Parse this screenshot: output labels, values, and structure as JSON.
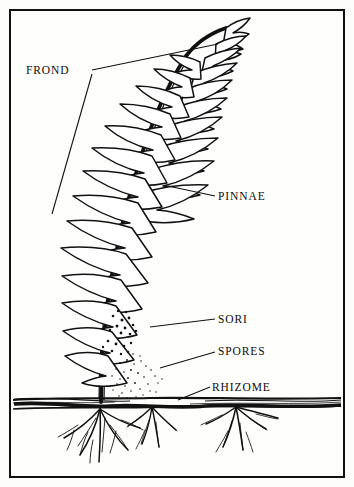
{
  "figure": {
    "background_color": "#fdfdfb",
    "ink_color": "#111111",
    "border_color": "#111111"
  },
  "labels": {
    "frond": "FROND",
    "pinnae": "PINNAE",
    "sori": "SORI",
    "spores": "SPORES",
    "rhizome": "RHIZOME"
  },
  "parts": [
    {
      "name": "frond",
      "label": "FROND",
      "description": "whole fern leaf, bracketed along left edge"
    },
    {
      "name": "pinnae",
      "label": "PINNAE",
      "description": "leaflets arranged along the rachis"
    },
    {
      "name": "sori",
      "label": "SORI",
      "description": "spore clusters on underside of lower pinna"
    },
    {
      "name": "spores",
      "label": "SPORES",
      "description": "stippled dots falling below the sori"
    },
    {
      "name": "rhizome",
      "label": "RHIZOME",
      "description": "horizontal underground stem at soil line"
    }
  ],
  "ground": {
    "soil_line_label": "",
    "root_count": 3
  }
}
